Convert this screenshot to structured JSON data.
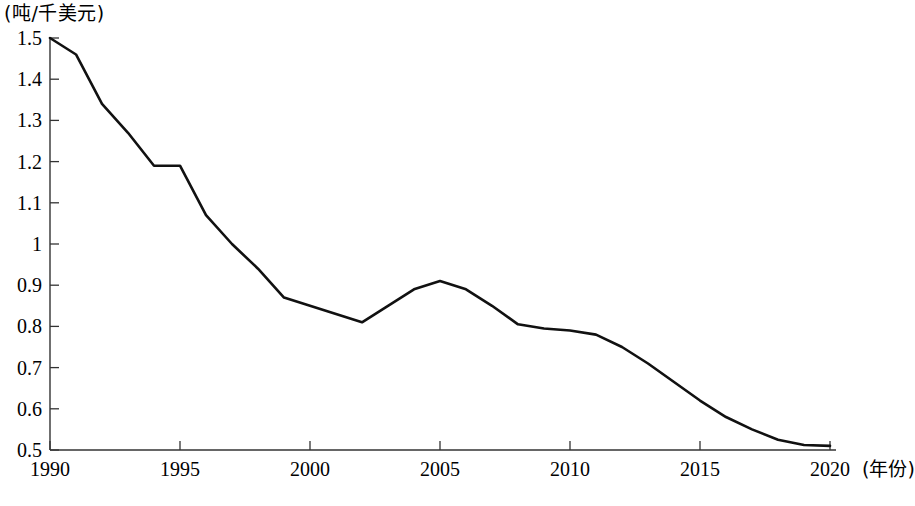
{
  "chart_data": {
    "type": "line",
    "title": "",
    "subtitle": "",
    "ylabel": "(吨/千美元)",
    "xlabel": "(年份)",
    "grid": false,
    "legend": null,
    "xlim": [
      1990,
      2020
    ],
    "ylim": [
      0.5,
      1.5
    ],
    "xticks": [
      1990,
      1995,
      2000,
      2005,
      2010,
      2015,
      2020
    ],
    "xtick_labels": [
      "1990",
      "1995",
      "2000",
      "2005",
      "2010",
      "2015",
      "2020"
    ],
    "yticks": [
      0.5,
      0.6,
      0.7,
      0.8,
      0.9,
      1.0,
      1.1,
      1.2,
      1.3,
      1.4,
      1.5
    ],
    "ytick_labels": [
      "0.5",
      "0.6",
      "0.7",
      "0.8",
      "0.9",
      "1",
      "1.1",
      "1.2",
      "1.3",
      "1.4",
      "1.5"
    ],
    "line_color": "#111111",
    "line_width": 2.6,
    "x": [
      1990,
      1991,
      1992,
      1993,
      1994,
      1995,
      1996,
      1997,
      1998,
      1999,
      2000,
      2001,
      2002,
      2003,
      2004,
      2005,
      2006,
      2007,
      2008,
      2009,
      2010,
      2011,
      2012,
      2013,
      2014,
      2015,
      2016,
      2017,
      2018,
      2019,
      2020
    ],
    "values": [
      1.5,
      1.46,
      1.34,
      1.27,
      1.19,
      1.19,
      1.07,
      1.0,
      0.94,
      0.87,
      0.85,
      0.83,
      0.81,
      0.85,
      0.89,
      0.91,
      0.89,
      0.85,
      0.805,
      0.795,
      0.79,
      0.78,
      0.75,
      0.71,
      0.665,
      0.62,
      0.58,
      0.55,
      0.525,
      0.512,
      0.51
    ],
    "series": [
      {
        "name": "单位GDP能耗",
        "values": [
          1.5,
          1.46,
          1.34,
          1.27,
          1.19,
          1.19,
          1.07,
          1.0,
          0.94,
          0.87,
          0.85,
          0.83,
          0.81,
          0.85,
          0.89,
          0.91,
          0.89,
          0.85,
          0.805,
          0.795,
          0.79,
          0.78,
          0.75,
          0.71,
          0.665,
          0.62,
          0.58,
          0.55,
          0.525,
          0.512,
          0.51
        ]
      }
    ]
  },
  "axes": {
    "y_unit_label": "(吨/千美元)",
    "x_unit_label": "(年份)"
  }
}
